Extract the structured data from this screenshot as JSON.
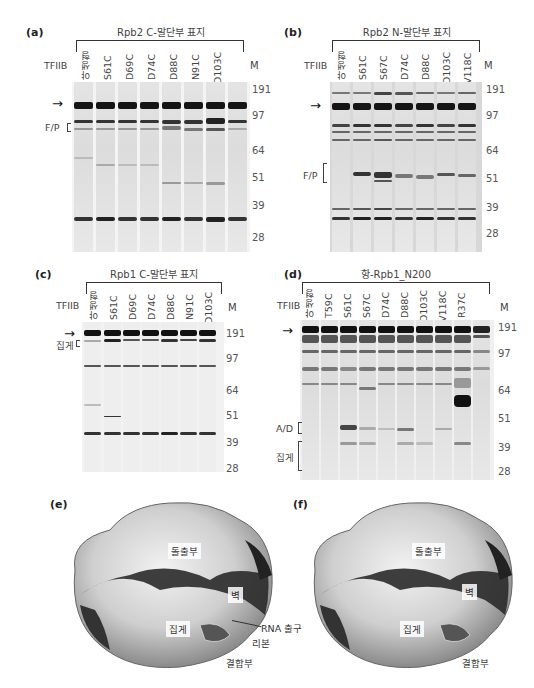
{
  "panels": {
    "a": {
      "label": "(a)",
      "title": "Rpb2 C-말단부 표지",
      "row_label": "TFIIB",
      "lanes": [
        "야생형",
        "S61C",
        "D69C",
        "D74C",
        "D88C",
        "N91C",
        "D103C",
        ""
      ],
      "marker_label": "M",
      "markers": [
        "191",
        "97",
        "64",
        "51",
        "39",
        "28"
      ],
      "annotations": [
        "F/P"
      ]
    },
    "b": {
      "label": "(b)",
      "title": "Rpb2 N-말단부 표지",
      "row_label": "TFIIB",
      "lanes": [
        "야생형",
        "S61C",
        "S67C",
        "D74C",
        "D88C",
        "D103C",
        "V118C"
      ],
      "marker_label": "M",
      "markers": [
        "191",
        "97",
        "64",
        "51",
        "39",
        "28"
      ],
      "annotations": [
        "F/P"
      ]
    },
    "c": {
      "label": "(c)",
      "title": "Rpb1 C-말단부 표지",
      "row_label": "TFIIB",
      "lanes": [
        "야생형",
        "S61C",
        "D69C",
        "D74C",
        "D88C",
        "N91C",
        "D103C"
      ],
      "marker_label": "M",
      "markers": [
        "191",
        "97",
        "64",
        "51",
        "39",
        "28"
      ],
      "annotations": [
        "집게"
      ]
    },
    "d": {
      "label": "(d)",
      "title": "항-Rpb1_N200",
      "row_label": "TFIIB",
      "lanes": [
        "야생형",
        "T59C",
        "S61C",
        "S67C",
        "D74C",
        "D88C",
        "D103C",
        "V118C",
        "R37C",
        ""
      ],
      "marker_label": "M",
      "markers": [
        "191",
        "97",
        "64",
        "51",
        "39",
        "28"
      ],
      "annotations": [
        "A/D",
        "집게"
      ]
    },
    "e": {
      "label": "(e)",
      "structure_labels": [
        "돌출부",
        "벽",
        "집게",
        "RNA 출구",
        "리본",
        "결합부"
      ]
    },
    "f": {
      "label": "(f)",
      "structure_labels": [
        "돌출부",
        "벽",
        "집게",
        "결합부"
      ]
    }
  },
  "colors": {
    "gel_bg": "#ececec",
    "band_dark": "#1a1a1a",
    "band_mid": "#555555",
    "band_light": "#9a9a9a",
    "structure_light": "#e6e6e6",
    "structure_dark": "#2a2a2a"
  }
}
